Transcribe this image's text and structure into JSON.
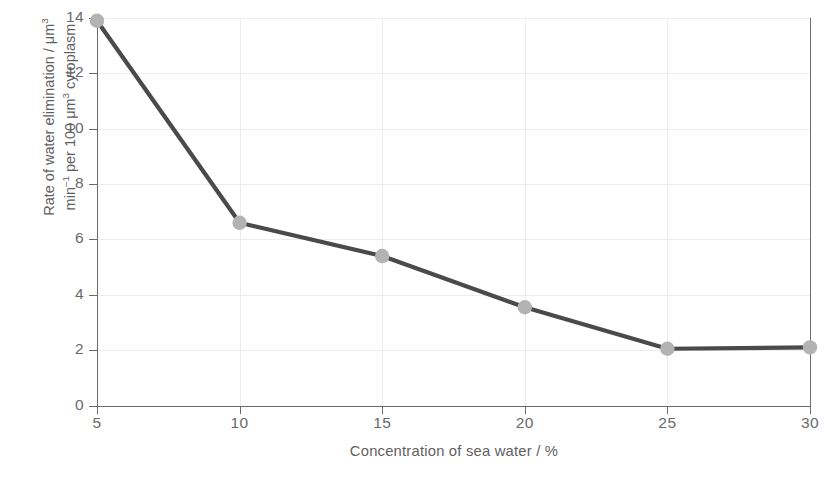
{
  "chart_data": {
    "type": "line",
    "title": "",
    "xlabel": "Concentration of sea water / %",
    "ylabel_line1": "Rate of water elimination / μm³",
    "ylabel_line2": "min⁻¹ per 100 μm³ cytoplasm",
    "x": [
      5,
      10,
      15,
      20,
      25,
      30
    ],
    "values": [
      13.9,
      6.6,
      5.4,
      3.55,
      2.05,
      2.1
    ],
    "xlim": [
      5,
      30
    ],
    "ylim": [
      0,
      14
    ],
    "xticks": [
      "5",
      "10",
      "15",
      "20",
      "25",
      "30"
    ],
    "yticks": [
      "0",
      "2",
      "4",
      "6",
      "8",
      "10",
      "12",
      "14"
    ],
    "grid": true,
    "legend": "none",
    "series_name": "Rate of water elimination",
    "line_color": "#4a4a4a",
    "marker_color": "#b3b3b3",
    "grid_color": "#ececec",
    "axis_color": "#6b6b6b",
    "text_color": "#6a6a6a",
    "background": "#ffffff"
  }
}
